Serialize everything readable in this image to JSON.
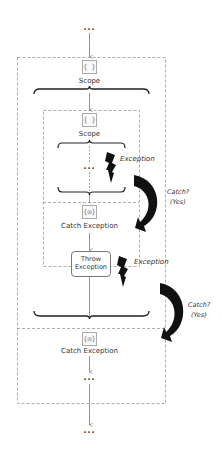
{
  "diagram": {
    "top_ellipsis": "...",
    "outer_scope": {
      "icon": "scope-braces-icon",
      "icon_glyph": "{ }",
      "label": "Scope"
    },
    "inner_scope": {
      "icon": "scope-braces-icon",
      "icon_glyph": "{ }",
      "label": "Scope",
      "ellipsis": "...",
      "exception_label": "Exception"
    },
    "inner_catch": {
      "icon": "catch-icon",
      "icon_glyph": "{◎}",
      "label": "Catch Exception",
      "throw_box": {
        "line1": "Throw",
        "line2": "Exception"
      },
      "exception_label": "Exception"
    },
    "catch_arrow_1": {
      "line1": "Catch?",
      "line2": "(Yes)"
    },
    "catch_arrow_2": {
      "line1": "Catch?",
      "line2": "(Yes)"
    },
    "outer_catch": {
      "icon": "catch-icon",
      "icon_glyph": "{◎}",
      "label": "Catch Exception",
      "ellipsis": "..."
    },
    "bottom_ellipsis": "...",
    "colors": {
      "line": "#555555",
      "dashed_border": "#999999",
      "arrow_fill": "#111111"
    }
  }
}
